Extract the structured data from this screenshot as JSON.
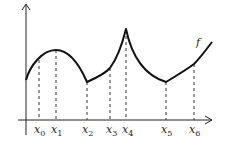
{
  "diagram": {
    "function_label": "f",
    "points": [
      {
        "name": "x0",
        "base": "x",
        "sub": "0",
        "px": 39,
        "py": 60
      },
      {
        "name": "x1",
        "base": "x",
        "sub": "1",
        "px": 56,
        "py": 50
      },
      {
        "name": "x2",
        "base": "x",
        "sub": "2",
        "px": 87,
        "py": 82
      },
      {
        "name": "x3",
        "base": "x",
        "sub": "3",
        "px": 110,
        "py": 68
      },
      {
        "name": "x4",
        "base": "x",
        "sub": "4",
        "px": 126,
        "py": 29
      },
      {
        "name": "x5",
        "base": "x",
        "sub": "5",
        "px": 166,
        "py": 82
      },
      {
        "name": "x6",
        "base": "x",
        "sub": "6",
        "px": 194,
        "py": 64
      }
    ],
    "colors": {
      "line": "#111111",
      "background": "#ffffff"
    }
  }
}
